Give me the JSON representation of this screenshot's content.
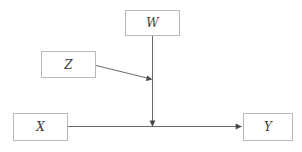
{
  "diagram": {
    "type": "causal-dag",
    "background_color": "#ffffff",
    "node_border_color": "#b9b9b9",
    "edge_color": "#595959",
    "label_color": "#3a3a3a",
    "nodes": [
      {
        "id": "W",
        "label": "W",
        "x": 125,
        "y": 10,
        "width": 55,
        "height": 26
      },
      {
        "id": "Z",
        "label": "Z",
        "x": 41,
        "y": 51,
        "width": 55,
        "height": 27
      },
      {
        "id": "X",
        "label": "X",
        "x": 13,
        "y": 113,
        "width": 55,
        "height": 28
      },
      {
        "id": "Y",
        "label": "Y",
        "x": 243,
        "y": 113,
        "width": 50,
        "height": 28
      }
    ],
    "edges": [
      {
        "from": "W",
        "to": "XY-path",
        "kind": "arrow",
        "direction": "down"
      },
      {
        "from": "Z",
        "to": "W-path",
        "kind": "arrow",
        "direction": "down-right"
      },
      {
        "from": "X",
        "to": "Y",
        "kind": "arrow",
        "direction": "right"
      }
    ]
  }
}
